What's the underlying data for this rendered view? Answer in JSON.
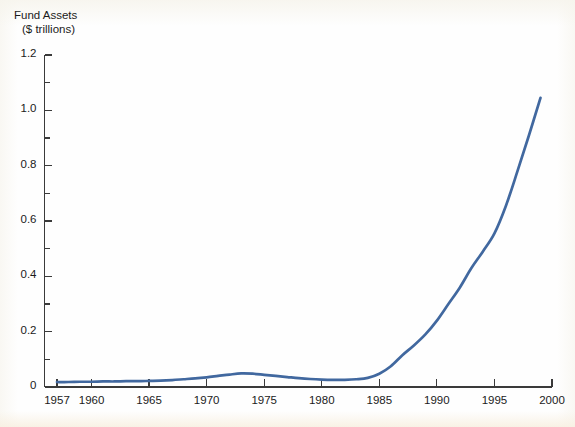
{
  "chart_data": {
    "type": "line",
    "title": "",
    "ylabel": "Fund Assets\n($ trillions)",
    "ylabel_line1": "Fund Assets",
    "ylabel_line2": "($ trillions)",
    "xlabel": "",
    "xlim": [
      1957,
      2000
    ],
    "ylim": [
      0,
      1.2
    ],
    "grid": false,
    "legend": "none",
    "y_ticks": [
      "0",
      "0.2",
      "0.4",
      "0.6",
      "0.8",
      "1.0",
      "1.2"
    ],
    "y_tick_values": [
      0,
      0.2,
      0.4,
      0.6,
      0.8,
      1.0,
      1.2
    ],
    "y_minor_tick_values": [
      0.1,
      0.3,
      0.5,
      0.7,
      0.9,
      1.1
    ],
    "x_ticks": [
      "1957",
      "1960",
      "1965",
      "1970",
      "1975",
      "1980",
      "1985",
      "1990",
      "1995",
      "2000"
    ],
    "x_tick_values": [
      1957,
      1960,
      1965,
      1970,
      1975,
      1980,
      1985,
      1990,
      1995,
      2000
    ],
    "line_color": "#41689f",
    "axis_color": "#3a3a3a",
    "series": [
      {
        "name": "Fund Assets",
        "x": [
          1957,
          1958,
          1959,
          1960,
          1961,
          1962,
          1963,
          1964,
          1965,
          1966,
          1967,
          1968,
          1969,
          1970,
          1971,
          1972,
          1973,
          1974,
          1975,
          1976,
          1977,
          1978,
          1979,
          1980,
          1981,
          1982,
          1983,
          1984,
          1985,
          1986,
          1987,
          1988,
          1989,
          1990,
          1991,
          1992,
          1993,
          1994,
          1995,
          1996,
          1997,
          1998,
          1999
        ],
        "values": [
          0.018,
          0.018,
          0.019,
          0.019,
          0.02,
          0.02,
          0.021,
          0.021,
          0.022,
          0.023,
          0.025,
          0.028,
          0.031,
          0.035,
          0.04,
          0.045,
          0.049,
          0.048,
          0.044,
          0.04,
          0.036,
          0.032,
          0.029,
          0.027,
          0.026,
          0.026,
          0.028,
          0.033,
          0.048,
          0.075,
          0.115,
          0.15,
          0.19,
          0.24,
          0.3,
          0.36,
          0.43,
          0.49,
          0.555,
          0.655,
          0.78,
          0.91,
          1.045
        ]
      }
    ]
  },
  "axes": {
    "y_title_line1": "Fund Assets",
    "y_title_line2": "($ trillions)"
  }
}
